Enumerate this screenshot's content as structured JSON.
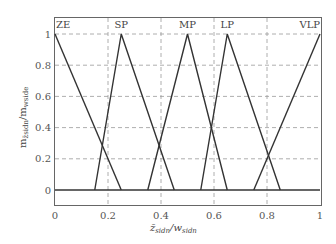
{
  "chart_data": {
    "type": "line",
    "title": "",
    "xlabel": "z̄_sidn / w_sidn",
    "ylabel": "m_z̄sidn / m_wside",
    "xlim": [
      0,
      1
    ],
    "ylim": [
      -0.1,
      1.1
    ],
    "grid": true,
    "legend": "none (series labeled inline at top of plot)",
    "x_ticks": [
      "0",
      "0.2",
      "0.4",
      "0.6",
      "0.8",
      "1"
    ],
    "y_ticks": [
      "0",
      "0.2",
      "0.4",
      "0.6",
      "0.8",
      "1"
    ],
    "series": [
      {
        "name": "ZE",
        "x": [
          0,
          0.25
        ],
        "y": [
          1,
          0
        ]
      },
      {
        "name": "SP",
        "x": [
          0.15,
          0.25,
          0.45
        ],
        "y": [
          0,
          1,
          0
        ]
      },
      {
        "name": "MP",
        "x": [
          0.35,
          0.5,
          0.65
        ],
        "y": [
          0,
          1,
          0
        ]
      },
      {
        "name": "LP",
        "x": [
          0.55,
          0.65,
          0.85
        ],
        "y": [
          0,
          1,
          0
        ]
      },
      {
        "name": "VLP",
        "x": [
          0.75,
          1
        ],
        "y": [
          0,
          1
        ]
      },
      {
        "name": "baseline",
        "x": [
          0,
          1
        ],
        "y": [
          0,
          0
        ]
      }
    ],
    "series_labels": [
      {
        "text": "ZE",
        "x": 0.0
      },
      {
        "text": "SP",
        "x": 0.25
      },
      {
        "text": "MP",
        "x": 0.5
      },
      {
        "text": "LP",
        "x": 0.65
      },
      {
        "text": "VLP",
        "x": 0.97
      }
    ]
  },
  "labels": {
    "x_axis_main": "z̄",
    "x_axis_sub": "sidn",
    "x_axis_div": "/w",
    "x_axis_sub2": "sidn",
    "y_axis_main": "m",
    "y_axis_sub": "z̄sidn",
    "y_axis_div": "/m",
    "y_axis_sub2": "wside"
  },
  "colors": {
    "line": "#333333",
    "grid": "#999999",
    "frame": "#666666",
    "text": "#555555"
  }
}
